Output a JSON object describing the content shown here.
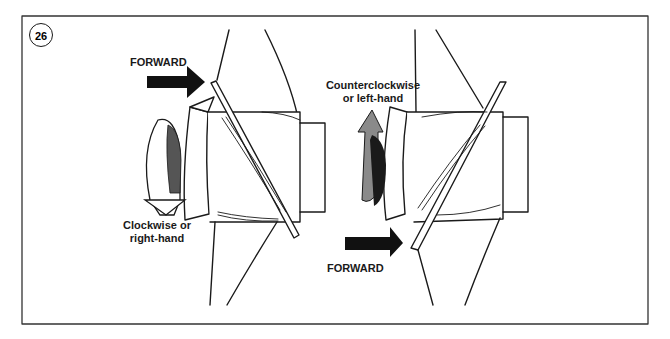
{
  "figure": {
    "number": "26",
    "left_propeller": {
      "forward_label": "FORWARD",
      "rotation_label_line1": "Clockwise or",
      "rotation_label_line2": "right-hand"
    },
    "right_propeller": {
      "forward_label": "FORWARD",
      "rotation_label_line1": "Counterclockwise",
      "rotation_label_line2": "or left-hand"
    }
  },
  "colors": {
    "line": "#1a1a1a",
    "arrow_dark": "#111111",
    "rotation_fill_dark": "#555555",
    "rotation_fill_gray": "#8a8a8a",
    "frame": "#333333"
  }
}
